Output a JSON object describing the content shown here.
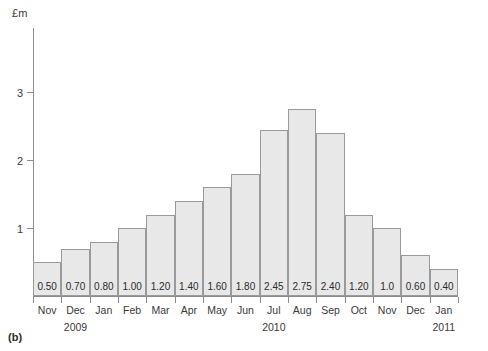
{
  "caption": "(b)",
  "chart_data": {
    "type": "bar",
    "title": "",
    "subtitle": "",
    "xlabel": "",
    "ylabel": "£m",
    "ylim": [
      0,
      3.95
    ],
    "grid": false,
    "legend": "none",
    "y_ticks": [
      {
        "value": 3,
        "label": "3"
      },
      {
        "value": 2,
        "label": "2"
      },
      {
        "value": 1,
        "label": "1"
      }
    ],
    "categories": [
      "Nov",
      "Dec",
      "Jan",
      "Feb",
      "Mar",
      "Apr",
      "May",
      "Jun",
      "Jul",
      "Aug",
      "Sep",
      "Oct",
      "Nov",
      "Dec",
      "Jan"
    ],
    "values": [
      0.5,
      0.7,
      0.8,
      1.0,
      1.2,
      1.4,
      1.6,
      1.8,
      2.45,
      2.75,
      2.4,
      1.2,
      1.0,
      0.6,
      0.4
    ],
    "data_labels": [
      "0.50",
      "0.70",
      "0.80",
      "1.00",
      "1.20",
      "1.40",
      "1.60",
      "1.80",
      "2.45",
      "2.75",
      "2.40",
      "1.20",
      "1.0",
      "0.60",
      "0.40"
    ],
    "year_groups": [
      {
        "label": "2009",
        "center_category_index": 1
      },
      {
        "label": "2010",
        "center_category_index": 8
      },
      {
        "label": "2011",
        "center_category_index": 14
      }
    ],
    "colors": {
      "bar_fill": "#e8e8e8",
      "bar_border": "#9a9a9a",
      "axis": "#8c8c8c",
      "text": "#2b2b2b"
    }
  }
}
